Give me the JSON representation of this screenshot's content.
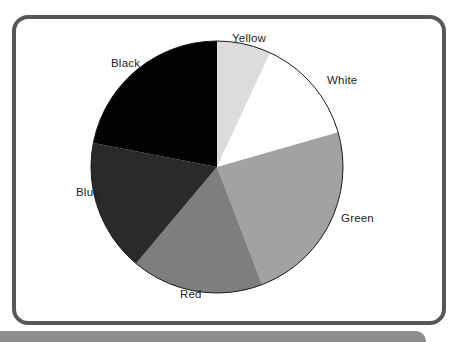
{
  "frame": {
    "border_color": "#555759",
    "base_bar_color": "#8b8d8f"
  },
  "chart_data": {
    "type": "pie",
    "title": "",
    "subtitle": "",
    "xlabel": "",
    "ylabel": "",
    "legend_position": "outside-labels",
    "grid": false,
    "start_angle_deg": 0,
    "direction": "clockwise",
    "categories": [
      "Yellow",
      "White",
      "Green",
      "Red",
      "Blue",
      "Black"
    ],
    "values": [
      7,
      13.5,
      23.5,
      17,
      17,
      22
    ],
    "units": "percent",
    "slices": [
      {
        "label": "Yellow",
        "value": 7,
        "angle_deg": 25,
        "color": "#dcdcdc",
        "start_deg": 0,
        "end_deg": 25
      },
      {
        "label": "White",
        "value": 13.5,
        "angle_deg": 49,
        "color": "#ffffff",
        "start_deg": 25,
        "end_deg": 74
      },
      {
        "label": "Green",
        "value": 23.5,
        "angle_deg": 85,
        "color": "#a2a2a2",
        "start_deg": 74,
        "end_deg": 159
      },
      {
        "label": "Red",
        "value": 17,
        "angle_deg": 61,
        "color": "#7e7e7e",
        "start_deg": 159,
        "end_deg": 220
      },
      {
        "label": "Blue",
        "value": 17,
        "angle_deg": 61,
        "color": "#2a2a2a",
        "start_deg": 220,
        "end_deg": 281
      },
      {
        "label": "Black",
        "value": 22,
        "angle_deg": 79,
        "color": "#020202",
        "start_deg": 281,
        "end_deg": 360
      }
    ],
    "geometry": {
      "center_x": 217,
      "center_y": 167,
      "radius": 126,
      "outline_color": "#1a1a1a"
    }
  },
  "labels": {
    "yellow": "Yellow",
    "white": "White",
    "green": "Green",
    "red": "Red",
    "blue": "Blue",
    "black": "Black"
  }
}
